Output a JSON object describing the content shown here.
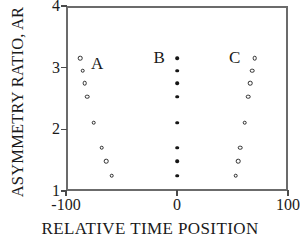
{
  "chart_data": {
    "type": "scatter",
    "title": "",
    "xlabel": "RELATIVE TIME POSITION",
    "ylabel": "ASYMMETRY RATIO, AR",
    "xlim": [
      -100,
      100
    ],
    "ylim": [
      1,
      4
    ],
    "xticks": [
      -100,
      0,
      100
    ],
    "xtick_labels": [
      "-100",
      "0",
      "100"
    ],
    "yticks": [
      1,
      2,
      3,
      4
    ],
    "ytick_labels": [
      "1",
      "2",
      "3",
      "4"
    ],
    "grid": false,
    "legend": "none",
    "annotations": [
      {
        "text": "A",
        "x": -72,
        "y": 3.06
      },
      {
        "text": "B",
        "x": -16,
        "y": 3.15
      },
      {
        "text": "C",
        "x": 52,
        "y": 3.15
      }
    ],
    "series": [
      {
        "name": "A",
        "marker": "open-circle",
        "points": [
          {
            "x": -87,
            "y": 3.15
          },
          {
            "x": -85,
            "y": 2.95
          },
          {
            "x": -83,
            "y": 2.75
          },
          {
            "x": -81,
            "y": 2.53
          },
          {
            "x": -75,
            "y": 2.11
          },
          {
            "x": -68,
            "y": 1.7
          },
          {
            "x": -64,
            "y": 1.48
          },
          {
            "x": -59,
            "y": 1.25
          }
        ]
      },
      {
        "name": "B",
        "marker": "filled-circle",
        "points": [
          {
            "x": 0,
            "y": 3.15
          },
          {
            "x": 0,
            "y": 2.95
          },
          {
            "x": 0,
            "y": 2.75
          },
          {
            "x": 0,
            "y": 2.53
          },
          {
            "x": 0,
            "y": 2.11
          },
          {
            "x": 0,
            "y": 1.7
          },
          {
            "x": 0,
            "y": 1.48
          },
          {
            "x": 0,
            "y": 1.25
          }
        ]
      },
      {
        "name": "C",
        "marker": "open-circle",
        "points": [
          {
            "x": 70,
            "y": 3.15
          },
          {
            "x": 68,
            "y": 2.95
          },
          {
            "x": 66,
            "y": 2.75
          },
          {
            "x": 64,
            "y": 2.53
          },
          {
            "x": 61,
            "y": 2.11
          },
          {
            "x": 57,
            "y": 1.7
          },
          {
            "x": 55,
            "y": 1.48
          },
          {
            "x": 53,
            "y": 1.25
          }
        ]
      }
    ]
  }
}
